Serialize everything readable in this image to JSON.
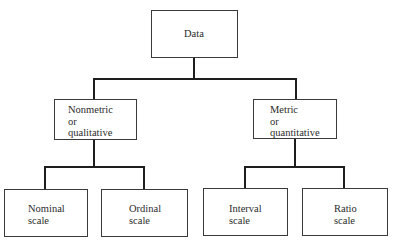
{
  "diagram": {
    "type": "tree",
    "root": {
      "label": "Data",
      "children": [
        {
          "label": "Nonmetric\nor\nqualitative",
          "children": [
            {
              "label": "Nominal\nscale"
            },
            {
              "label": "Ordinal\nscale"
            }
          ]
        },
        {
          "label": "Metric\nor\nquantitative",
          "children": [
            {
              "label": "Interval\nscale"
            },
            {
              "label": "Ratio\nscale"
            }
          ]
        }
      ]
    }
  },
  "nodes": {
    "data": "Data",
    "nonmetric": "Nonmetric\nor\nqualitative",
    "metric": "Metric\nor\nquantitative",
    "nominal": "Nominal\nscale",
    "ordinal": "Ordinal\nscale",
    "interval": "Interval\nscale",
    "ratio": "Ratio\nscale"
  },
  "colors": {
    "line": "#1e1e1e",
    "border": "#3a3a3a",
    "text": "#2b2b2b",
    "background": "#ffffff"
  }
}
